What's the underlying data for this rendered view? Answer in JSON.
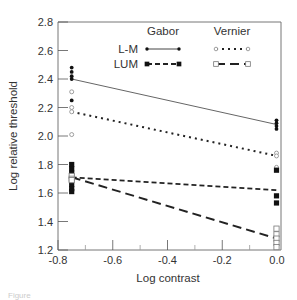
{
  "chart_data": {
    "type": "line",
    "title": "",
    "xlabel": "Log contrast",
    "ylabel": "Log relative threshold",
    "xlim": [
      -0.8,
      0.0
    ],
    "ylim": [
      1.2,
      2.8
    ],
    "x_ticks": [
      -0.8,
      -0.6,
      -0.4,
      -0.2,
      0.0
    ],
    "x_tick_labels": [
      "-0.8",
      "-0.6",
      "-0.4",
      "-0.2",
      "0.0"
    ],
    "x_minor_ticks": [
      -0.7,
      -0.5,
      -0.3,
      -0.1
    ],
    "y_ticks": [
      1.2,
      1.4,
      1.6,
      1.8,
      2.0,
      2.2,
      2.4,
      2.6,
      2.8
    ],
    "y_tick_labels": [
      "1.2",
      "1.4",
      "1.6",
      "1.8",
      "2.0",
      "2.2",
      "2.4",
      "2.6",
      "2.8"
    ],
    "grid": false,
    "legend": {
      "position": "upper right",
      "columns": [
        "Gabor",
        "Vernier"
      ],
      "rows": [
        "L-M",
        "LUM"
      ]
    },
    "series": [
      {
        "name": "L-M Gabor",
        "line_style": "solid",
        "marker": "filled-circle",
        "fit_line": {
          "x": [
            -0.75,
            0.0
          ],
          "y": [
            2.4,
            2.08
          ]
        },
        "points": [
          {
            "x": -0.75,
            "y": 2.48
          },
          {
            "x": -0.75,
            "y": 2.45
          },
          {
            "x": -0.75,
            "y": 2.42
          },
          {
            "x": -0.75,
            "y": 2.4
          },
          {
            "x": -0.75,
            "y": 2.25
          },
          {
            "x": 0.0,
            "y": 2.11
          },
          {
            "x": 0.0,
            "y": 2.09
          },
          {
            "x": 0.0,
            "y": 2.07
          },
          {
            "x": 0.0,
            "y": 2.05
          }
        ]
      },
      {
        "name": "L-M Vernier",
        "line_style": "dotted",
        "marker": "open-circle",
        "fit_line": {
          "x": [
            -0.75,
            0.0
          ],
          "y": [
            2.17,
            1.86
          ]
        },
        "points": [
          {
            "x": -0.75,
            "y": 2.31
          },
          {
            "x": -0.75,
            "y": 2.2
          },
          {
            "x": -0.75,
            "y": 2.17
          },
          {
            "x": -0.75,
            "y": 2.01
          },
          {
            "x": 0.0,
            "y": 1.88
          },
          {
            "x": 0.0,
            "y": 1.86
          },
          {
            "x": 0.0,
            "y": 1.78
          }
        ]
      },
      {
        "name": "LUM Gabor",
        "line_style": "short-dashed",
        "marker": "filled-square",
        "fit_line": {
          "x": [
            -0.75,
            0.0
          ],
          "y": [
            1.71,
            1.62
          ]
        },
        "points": [
          {
            "x": -0.75,
            "y": 1.8
          },
          {
            "x": -0.75,
            "y": 1.77
          },
          {
            "x": -0.75,
            "y": 1.74
          },
          {
            "x": -0.75,
            "y": 1.66
          },
          {
            "x": -0.75,
            "y": 1.63
          },
          {
            "x": -0.75,
            "y": 1.61
          },
          {
            "x": 0.0,
            "y": 1.76
          },
          {
            "x": 0.0,
            "y": 1.58
          },
          {
            "x": 0.0,
            "y": 1.53
          }
        ]
      },
      {
        "name": "LUM Vernier",
        "line_style": "long-dashed",
        "marker": "open-square",
        "fit_line": {
          "x": [
            -0.75,
            0.0
          ],
          "y": [
            1.71,
            1.28
          ]
        },
        "points": [
          {
            "x": -0.75,
            "y": 1.72
          },
          {
            "x": -0.75,
            "y": 1.7
          },
          {
            "x": -0.75,
            "y": 1.69
          },
          {
            "x": 0.0,
            "y": 1.35
          },
          {
            "x": 0.0,
            "y": 1.31
          },
          {
            "x": 0.0,
            "y": 1.28
          },
          {
            "x": 0.0,
            "y": 1.25
          },
          {
            "x": 0.0,
            "y": 1.22
          }
        ]
      }
    ]
  },
  "caption": {
    "text": "Figure"
  }
}
